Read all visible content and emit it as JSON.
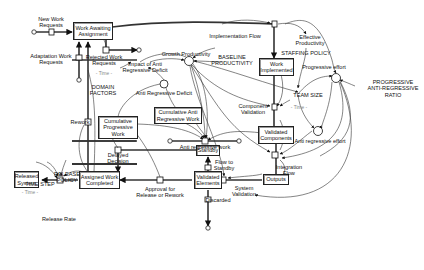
{
  "diagram": {
    "type": "system-dynamics stock-and-flow",
    "stocks": [
      {
        "id": "work_awaiting",
        "label": "Work Awaiting\nAssignment"
      },
      {
        "id": "work_implemented",
        "label": "Work\nImplemented"
      },
      {
        "id": "cum_anti",
        "label": "Cumulative Anti\nRegressive Work"
      },
      {
        "id": "cum_prog",
        "label": "Cumulative\nProgressive\nWork"
      },
      {
        "id": "validated_components",
        "label": "Validated\nComponents"
      },
      {
        "id": "standby",
        "label": "Standby"
      },
      {
        "id": "outputs",
        "label": "Outputs"
      },
      {
        "id": "validated_elements",
        "label": "Validated\nElements"
      },
      {
        "id": "assigned_completed",
        "label": "Assigned Work\nCompleted"
      },
      {
        "id": "released_system",
        "label": "Released\nSystem"
      }
    ],
    "flows": [
      {
        "id": "new_work",
        "label": "New Work\nRequests"
      },
      {
        "id": "adaptation",
        "label": "Adaptation Work\nRequests"
      },
      {
        "id": "rejected",
        "label": "Rejected Work\nRequests"
      },
      {
        "id": "impl_flow",
        "label": "Implementation Flow"
      },
      {
        "id": "component_validation",
        "label": "Component\nValidation"
      },
      {
        "id": "anti_work",
        "label": "Anti regressive work"
      },
      {
        "id": "integration",
        "label": "Integration\nFlow"
      },
      {
        "id": "system_validation",
        "label": "System\nValidation"
      },
      {
        "id": "flow_standby",
        "label": "Flow to\nStandby"
      },
      {
        "id": "discarded",
        "label": "Discarded"
      },
      {
        "id": "approval",
        "label": "Approval for\nRelease or Rework"
      },
      {
        "id": "delayed",
        "label": "Delayed\nDecision"
      },
      {
        "id": "rework",
        "label": "Rework"
      },
      {
        "id": "release_rate",
        "label": "Release Rate"
      }
    ],
    "auxiliaries": [
      {
        "id": "growth_productivity",
        "label": "Growth Productivity"
      },
      {
        "id": "baseline",
        "label": "BASELINE\nPRODUCTIVITY"
      },
      {
        "id": "effective_productivity",
        "label": "Effective\nProductivity"
      },
      {
        "id": "staffing_policy",
        "label": "STAFFING POLICY"
      },
      {
        "id": "progressive_effort",
        "label": "Progressive effort"
      },
      {
        "id": "par_ratio",
        "label": "PROGRESSIVE\nANTI-REGRESSIVE\nRATIO"
      },
      {
        "id": "team_size",
        "label": "TEAM SIZE"
      },
      {
        "id": "anti_effort",
        "label": "Anti regressive effort"
      },
      {
        "id": "impact_deficit",
        "label": "Impact of Anti\nRegressive Deficit"
      },
      {
        "id": "anti_deficit",
        "label": "Anti Regressive Deficit"
      },
      {
        "id": "domain_factors",
        "label": "DOMAIN\nFACTORS"
      },
      {
        "id": "release_policy",
        "label": "RELEASE\nPOLICY"
      },
      {
        "id": "time_step",
        "label": "TIME STEP"
      }
    ],
    "graph_markers": {
      "time_a": "- Time -",
      "time_b": "- Time -",
      "time_c": "- Time -"
    }
  }
}
